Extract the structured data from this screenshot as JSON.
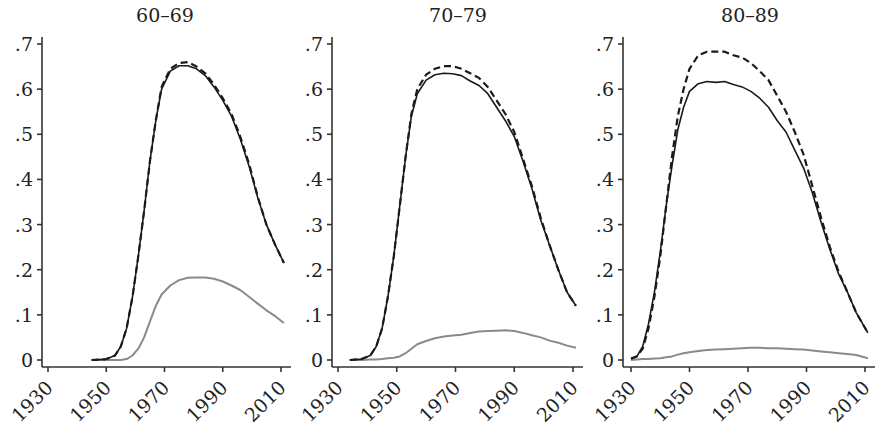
{
  "chart_data": [
    {
      "type": "line",
      "title": "60–69",
      "xlabel": "",
      "ylabel": "",
      "xlim": [
        1930,
        2012
      ],
      "ylim": [
        0,
        0.7
      ],
      "xticks": [
        "1930",
        "1950",
        "1970",
        "1990",
        "2010"
      ],
      "yticks": [
        "0",
        ".1",
        ".2",
        ".3",
        ".4",
        ".5",
        ".6",
        ".7"
      ],
      "grid": false,
      "legend": "none",
      "x": [
        1945,
        1950,
        1953,
        1955,
        1957,
        1959,
        1961,
        1963,
        1965,
        1967,
        1969,
        1972,
        1975,
        1978,
        1981,
        1984,
        1987,
        1990,
        1993,
        1996,
        1999,
        2002,
        2005,
        2008,
        2011
      ],
      "series": [
        {
          "name": "solid",
          "style": "solid-black",
          "values": [
            0.0,
            0.002,
            0.01,
            0.03,
            0.07,
            0.14,
            0.23,
            0.33,
            0.44,
            0.53,
            0.6,
            0.64,
            0.652,
            0.652,
            0.645,
            0.63,
            0.605,
            0.575,
            0.54,
            0.49,
            0.43,
            0.36,
            0.3,
            0.255,
            0.215
          ]
        },
        {
          "name": "dashed",
          "style": "dashed-black",
          "values": [
            0.0,
            0.002,
            0.01,
            0.03,
            0.07,
            0.14,
            0.23,
            0.33,
            0.44,
            0.53,
            0.605,
            0.645,
            0.658,
            0.66,
            0.65,
            0.635,
            0.61,
            0.58,
            0.545,
            0.495,
            0.435,
            0.362,
            0.3,
            0.255,
            0.215
          ]
        },
        {
          "name": "grey",
          "style": "solid-grey",
          "values": [
            0.0,
            0.0,
            0.0,
            0.0,
            0.002,
            0.01,
            0.025,
            0.05,
            0.085,
            0.12,
            0.145,
            0.165,
            0.177,
            0.182,
            0.183,
            0.183,
            0.18,
            0.174,
            0.165,
            0.155,
            0.14,
            0.125,
            0.11,
            0.097,
            0.082
          ]
        }
      ]
    },
    {
      "type": "line",
      "title": "70–79",
      "xlabel": "",
      "ylabel": "",
      "xlim": [
        1930,
        2012
      ],
      "ylim": [
        0,
        0.7
      ],
      "xticks": [
        "1930",
        "1950",
        "1970",
        "1990",
        "2010"
      ],
      "yticks": [
        "0",
        ".1",
        ".2",
        ".3",
        ".4",
        ".5",
        ".6",
        ".7"
      ],
      "grid": false,
      "legend": "none",
      "x": [
        1934,
        1938,
        1941,
        1943,
        1945,
        1947,
        1949,
        1951,
        1953,
        1955,
        1957,
        1960,
        1963,
        1966,
        1969,
        1972,
        1975,
        1978,
        1981,
        1984,
        1987,
        1990,
        1993,
        1996,
        1999,
        2002,
        2005,
        2008,
        2011
      ],
      "series": [
        {
          "name": "solid",
          "style": "solid-black",
          "values": [
            0.0,
            0.002,
            0.01,
            0.03,
            0.07,
            0.14,
            0.23,
            0.34,
            0.45,
            0.54,
            0.59,
            0.62,
            0.632,
            0.635,
            0.634,
            0.63,
            0.618,
            0.608,
            0.59,
            0.56,
            0.53,
            0.495,
            0.44,
            0.38,
            0.31,
            0.255,
            0.2,
            0.15,
            0.12
          ]
        },
        {
          "name": "dashed",
          "style": "dashed-black",
          "values": [
            0.0,
            0.002,
            0.01,
            0.03,
            0.07,
            0.14,
            0.23,
            0.34,
            0.45,
            0.545,
            0.6,
            0.632,
            0.645,
            0.651,
            0.651,
            0.645,
            0.635,
            0.625,
            0.605,
            0.575,
            0.545,
            0.505,
            0.445,
            0.385,
            0.315,
            0.255,
            0.2,
            0.15,
            0.12
          ]
        },
        {
          "name": "grey",
          "style": "solid-grey",
          "values": [
            0.0,
            0.0,
            0.001,
            0.001,
            0.002,
            0.004,
            0.005,
            0.008,
            0.015,
            0.025,
            0.035,
            0.042,
            0.048,
            0.052,
            0.054,
            0.056,
            0.06,
            0.063,
            0.064,
            0.065,
            0.066,
            0.064,
            0.06,
            0.055,
            0.05,
            0.043,
            0.038,
            0.032,
            0.027
          ]
        }
      ]
    },
    {
      "type": "line",
      "title": "80–89",
      "xlabel": "",
      "ylabel": "",
      "xlim": [
        1930,
        2012
      ],
      "ylim": [
        0,
        0.7
      ],
      "xticks": [
        "1930",
        "1950",
        "1970",
        "1990",
        "2010"
      ],
      "yticks": [
        "0",
        ".1",
        ".2",
        ".3",
        ".4",
        ".5",
        ".6",
        ".7"
      ],
      "grid": false,
      "legend": "none",
      "x": [
        1930,
        1932,
        1934,
        1936,
        1938,
        1940,
        1942,
        1944,
        1946,
        1948,
        1950,
        1953,
        1956,
        1959,
        1962,
        1965,
        1968,
        1971,
        1974,
        1977,
        1980,
        1983,
        1986,
        1989,
        1992,
        1995,
        1998,
        2001,
        2004,
        2007,
        2011
      ],
      "series": [
        {
          "name": "solid",
          "style": "solid-black",
          "values": [
            0.003,
            0.008,
            0.03,
            0.08,
            0.15,
            0.24,
            0.34,
            0.43,
            0.51,
            0.56,
            0.595,
            0.612,
            0.617,
            0.615,
            0.617,
            0.61,
            0.605,
            0.595,
            0.58,
            0.56,
            0.53,
            0.505,
            0.465,
            0.425,
            0.37,
            0.305,
            0.245,
            0.19,
            0.15,
            0.105,
            0.06
          ]
        },
        {
          "name": "dashed",
          "style": "dashed-black",
          "values": [
            0.003,
            0.008,
            0.025,
            0.07,
            0.14,
            0.23,
            0.34,
            0.45,
            0.54,
            0.6,
            0.645,
            0.675,
            0.683,
            0.683,
            0.683,
            0.675,
            0.67,
            0.658,
            0.64,
            0.62,
            0.585,
            0.55,
            0.505,
            0.455,
            0.385,
            0.315,
            0.25,
            0.195,
            0.15,
            0.105,
            0.06
          ]
        },
        {
          "name": "grey",
          "style": "solid-grey",
          "values": [
            0.0,
            0.001,
            0.002,
            0.002,
            0.003,
            0.004,
            0.006,
            0.008,
            0.012,
            0.015,
            0.017,
            0.02,
            0.022,
            0.023,
            0.024,
            0.025,
            0.026,
            0.027,
            0.027,
            0.026,
            0.026,
            0.025,
            0.024,
            0.023,
            0.021,
            0.019,
            0.017,
            0.015,
            0.013,
            0.011,
            0.004
          ]
        }
      ]
    }
  ]
}
